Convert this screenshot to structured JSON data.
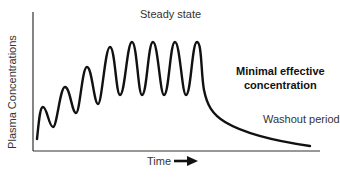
{
  "diagram": {
    "y_axis_label": "Plasma Concentrations",
    "x_axis_label": "Time",
    "x_axis_arrow": "right-arrow",
    "annotations": {
      "steady_state": "Steady state",
      "minimal_effective_line1": "Minimal effective",
      "minimal_effective_line2": "concentration",
      "washout": "Washout period"
    },
    "colors": {
      "curve": "#111111",
      "axis": "#333333",
      "background": "#ffffff"
    }
  }
}
